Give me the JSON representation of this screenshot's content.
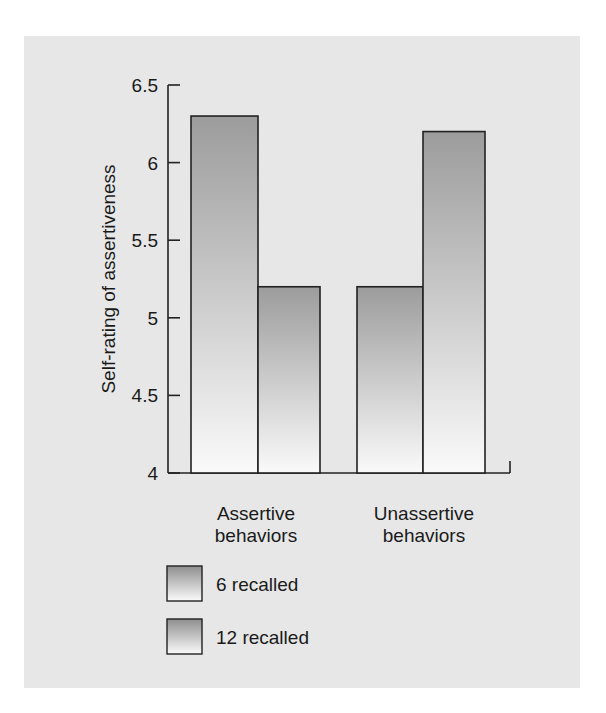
{
  "chart_data": {
    "type": "bar",
    "title": "",
    "xlabel": "",
    "ylabel": "Self-rating of assertiveness",
    "ylim": [
      4,
      6.5
    ],
    "yticks": [
      "4",
      "4.5",
      "5",
      "5.5",
      "6",
      "6.5"
    ],
    "grid": false,
    "legend_position": "bottom-left",
    "categories": [
      "Assertive behaviors",
      "Unassertive behaviors"
    ],
    "category_lines": [
      [
        "Assertive",
        "behaviors"
      ],
      [
        "Unassertive",
        "behaviors"
      ]
    ],
    "series": [
      {
        "name": "6 recalled",
        "values": [
          6.3,
          5.2
        ]
      },
      {
        "name": "12 recalled",
        "values": [
          5.2,
          6.2
        ]
      }
    ]
  },
  "colors": {
    "panel_bg": "#e7e7e7",
    "bar_top": "#9c9c9c",
    "bar_bottom": "#fafafa",
    "axis": "#222222"
  }
}
